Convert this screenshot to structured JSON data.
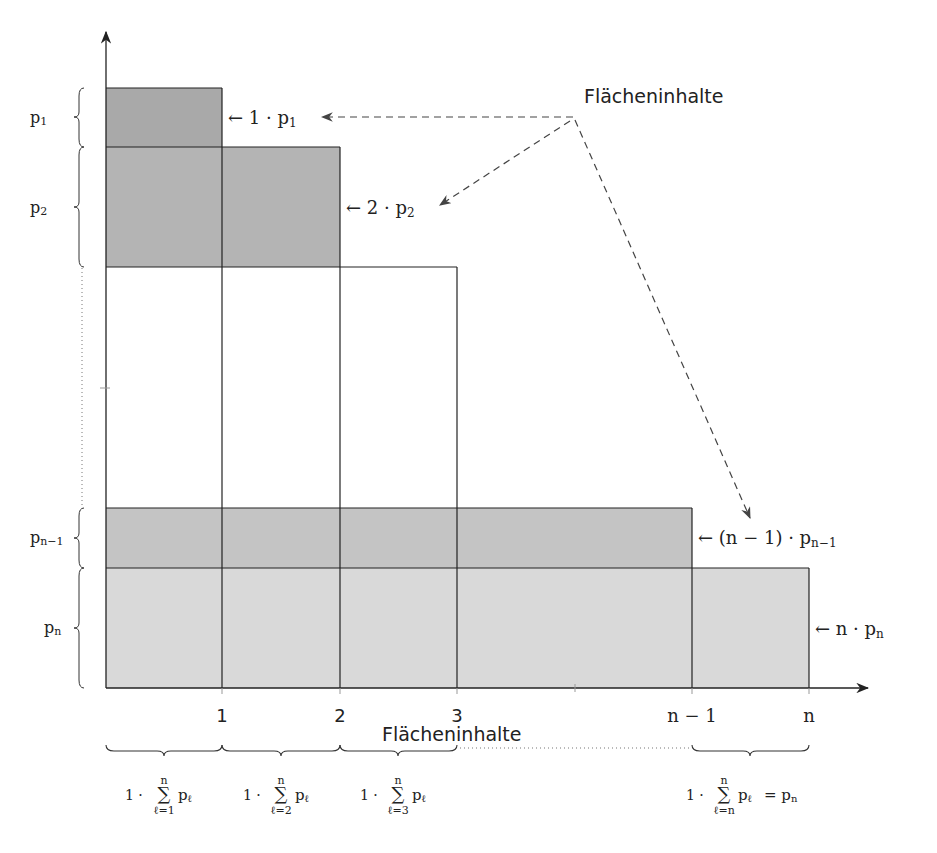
{
  "diagram": {
    "title_label": "Flächeninhalte",
    "x_axis_label": "Flächeninhalte",
    "colors": {
      "dark_fill": "#a9a9a9",
      "medium_fill": "#bdbdbd",
      "light_fill": "#d9d9d9",
      "line": "#222222",
      "background": "#ffffff"
    },
    "x_ticks": [
      {
        "label": "1"
      },
      {
        "label": "2"
      },
      {
        "label": "3"
      },
      {
        "label": "n − 1"
      },
      {
        "label": "n"
      }
    ],
    "y_labels": [
      {
        "main": "p",
        "sub": "1"
      },
      {
        "main": "p",
        "sub": "2"
      },
      {
        "main": "p",
        "sub": "n−1"
      },
      {
        "main": "p",
        "sub": "n"
      }
    ],
    "area_annotations": [
      {
        "prefix": "← 1 · p",
        "sub": "1"
      },
      {
        "prefix": "← 2 · p",
        "sub": "2"
      },
      {
        "prefix": "← (n − 1) · p",
        "sub": "n−1"
      },
      {
        "prefix": "← n · p",
        "sub": "n"
      }
    ],
    "column_sums": [
      {
        "factor": "1 ·",
        "upper": "n",
        "lower": "ℓ=1",
        "term": "p",
        "term_sub": "ℓ",
        "suffix": ""
      },
      {
        "factor": "1 ·",
        "upper": "n",
        "lower": "ℓ=2",
        "term": "p",
        "term_sub": "ℓ",
        "suffix": ""
      },
      {
        "factor": "1 ·",
        "upper": "n",
        "lower": "ℓ=3",
        "term": "p",
        "term_sub": "ℓ",
        "suffix": ""
      },
      {
        "factor": "1 ·",
        "upper": "n",
        "lower": "ℓ=n",
        "term": "p",
        "term_sub": "ℓ",
        "suffix": "= p",
        "suffix_sub": "n"
      }
    ],
    "sigma": "∑"
  }
}
